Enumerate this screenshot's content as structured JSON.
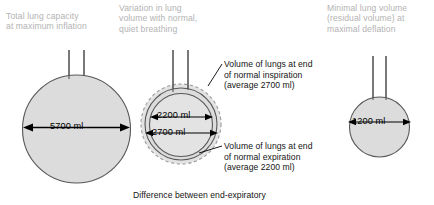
{
  "diagram": {
    "title_hidden": "",
    "panels": [
      {
        "id": "total-lung-capacity",
        "header": "Total lung capacity\nat maximum inflation",
        "dimension_label": "5700 ml",
        "volume_ml": 5700
      },
      {
        "id": "tidal-variation",
        "header": "Variation in lung\nvolume with normal,\nquiet breathing",
        "dimension_label_inner": "2200 ml",
        "dimension_label_outer": "2700 ml",
        "volume_inner_ml": 2200,
        "volume_outer_ml": 2700
      },
      {
        "id": "residual-volume",
        "header": "Minimal lung volume\n(residual volume) at\nmaximal deflation",
        "dimension_label": "1200 ml",
        "volume_ml": 1200
      }
    ],
    "callouts": [
      {
        "id": "end-inspiration",
        "text": "Volume of lungs at end\nof normal inspiration\n(average 2700 ml)"
      },
      {
        "id": "end-expiration",
        "text": "Volume of lungs at end\nof normal expiration\n(average 2200 ml)"
      }
    ],
    "caption": "Difference between end-expiratory",
    "colors": {
      "fill_grey": "#dcdcdc",
      "fill_grey_light": "#e3e3e3",
      "outline": "#58585a",
      "header_text": "#b3b3b3",
      "body_text": "#141414",
      "background": "#ffffff"
    }
  }
}
